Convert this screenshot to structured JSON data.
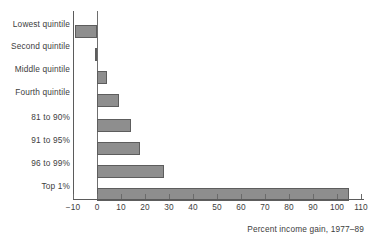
{
  "chart_data": {
    "type": "bar",
    "orientation": "horizontal",
    "title": "",
    "xlabel": "Percent income gain, 1977–89",
    "ylabel": "",
    "categories": [
      "Lowest quintile",
      "Second quintile",
      "Middle quintile",
      "Fourth quintile",
      "81 to 90%",
      "91 to 95%",
      "96 to 99%",
      "Top 1%"
    ],
    "values": [
      -9,
      -1,
      4,
      9,
      14,
      18,
      28,
      105
    ],
    "xlim": [
      -10,
      110
    ],
    "xtick_labels": [
      "−10",
      "0",
      "10",
      "20",
      "30",
      "40",
      "50",
      "60",
      "70",
      "80",
      "90",
      "100",
      "110"
    ],
    "xticks": [
      -10,
      0,
      10,
      20,
      30,
      40,
      50,
      60,
      70,
      80,
      90,
      100,
      110
    ],
    "grid": false,
    "legend": null,
    "bar_fill_color": "#8e8e8e",
    "bar_edge_color": "#5d5d5d",
    "axis_color": "#5b5b5b",
    "text_color": "#3d3d3d",
    "background_color": "#ffffff"
  }
}
